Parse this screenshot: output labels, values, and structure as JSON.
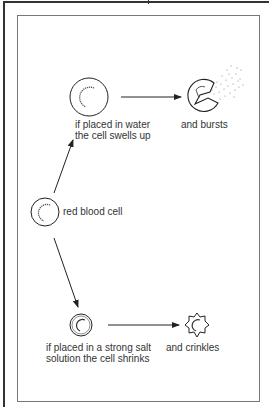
{
  "diagram": {
    "title": "",
    "nodes": {
      "red_blood_cell": {
        "label": "red blood cell"
      },
      "water_cell": {
        "label_line1": "if placed in water",
        "label_line2": "the cell swells up"
      },
      "burst_cell": {
        "label": "and bursts"
      },
      "salt_cell": {
        "label_line1": "if placed in a strong salt",
        "label_line2": "solution the cell shrinks"
      },
      "crinkled_cell": {
        "label": "and crinkles"
      }
    },
    "edges": [
      {
        "from": "red_blood_cell",
        "to": "water_cell"
      },
      {
        "from": "water_cell",
        "to": "burst_cell"
      },
      {
        "from": "red_blood_cell",
        "to": "salt_cell"
      },
      {
        "from": "salt_cell",
        "to": "crinkled_cell"
      }
    ],
    "colors": {
      "line": "#222222",
      "frame": "#777777",
      "background": "#ffffff"
    }
  }
}
